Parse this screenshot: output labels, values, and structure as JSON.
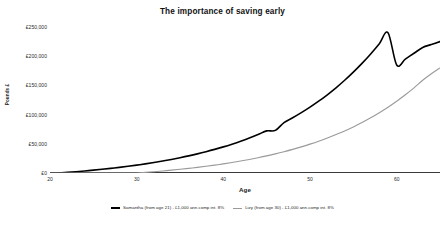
{
  "chart_data": {
    "type": "line",
    "title": "The importance of saving early",
    "xlabel": "Age",
    "ylabel": "Pounds £",
    "xlim": [
      20,
      65
    ],
    "ylim": [
      0,
      250000
    ],
    "grid": false,
    "legend_position": "bottom",
    "x_ticks": [
      "20",
      "30",
      "40",
      "50",
      "60"
    ],
    "x_tick_values": [
      20,
      30,
      40,
      50,
      60
    ],
    "y_ticks": [
      "£0",
      "£50,000",
      "£100,000",
      "£150,000",
      "£200,000",
      "£250,000"
    ],
    "y_tick_values": [
      0,
      50000,
      100000,
      150000,
      200000,
      250000
    ],
    "x": [
      20,
      21,
      22,
      23,
      24,
      25,
      26,
      27,
      28,
      29,
      30,
      31,
      32,
      33,
      34,
      35,
      36,
      37,
      38,
      39,
      40,
      41,
      42,
      43,
      44,
      45,
      46,
      47,
      48,
      49,
      50,
      51,
      52,
      53,
      54,
      55,
      56,
      57,
      58,
      59,
      60,
      61,
      62,
      63,
      64,
      65
    ],
    "series": [
      {
        "name": "Samantha (from age 21) - £1,000 ann.comp int. 8%",
        "color": "#000000",
        "width": 1.6,
        "values": [
          0,
          0,
          1080,
          2246,
          3506,
          4867,
          6336,
          7923,
          9637,
          11488,
          13487,
          15645,
          17977,
          20495,
          23215,
          26152,
          29324,
          32750,
          36450,
          40446,
          44762,
          49423,
          54457,
          59894,
          65765,
          72106,
          72954,
          86391,
          94502,
          103262,
          112723,
          122941,
          133977,
          145895,
          158767,
          172668,
          187681,
          203896,
          221408,
          240321,
          185000,
          195000,
          205000,
          215000,
          220000,
          225000
        ]
      },
      {
        "name": "Lizy (from age 30) - £1,000 ann.comp int. 8%",
        "color": "#9a9a9a",
        "width": 1.1,
        "values": [
          0,
          0,
          0,
          0,
          0,
          0,
          0,
          0,
          0,
          0,
          0,
          1080,
          2246,
          3506,
          4867,
          6336,
          7923,
          9637,
          11488,
          13487,
          15645,
          17977,
          20495,
          23215,
          26152,
          29324,
          32750,
          36450,
          40446,
          44762,
          49423,
          54457,
          59894,
          65765,
          72106,
          78954,
          86391,
          94502,
          103262,
          112723,
          122941,
          133977,
          145895,
          158767,
          170000,
          180000
        ]
      }
    ]
  },
  "legend": {
    "items": [
      {
        "label": "Samantha (from age 21) - £1,000 ann.comp int. 8%"
      },
      {
        "label": "Lizy (from age 30) - £1,000 ann.comp int. 8%"
      }
    ]
  }
}
